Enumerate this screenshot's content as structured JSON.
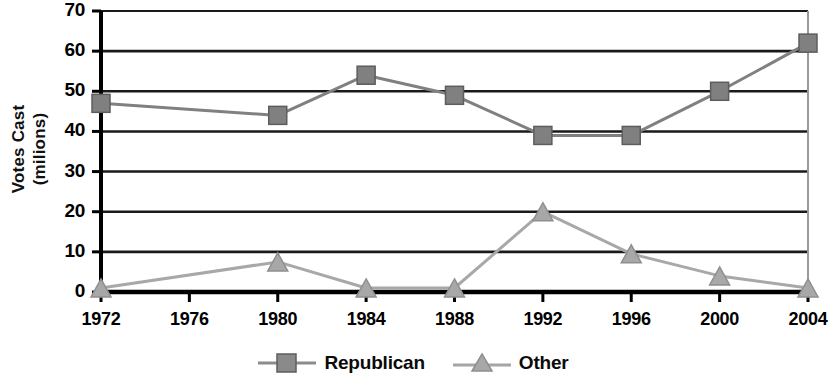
{
  "chart_data": {
    "type": "line",
    "title": "",
    "xlabel": "",
    "ylabel": "Votes Cast (milions)",
    "ylabel_lines": [
      "Votes Cast",
      "(milions)"
    ],
    "categories": [
      "1972",
      "1976",
      "1980",
      "1984",
      "1988",
      "1992",
      "1996",
      "2000",
      "2004"
    ],
    "xtick_labels": [
      "1972",
      "1976",
      "1980",
      "1984",
      "1988",
      "1992",
      "1996",
      "2000",
      "2004"
    ],
    "ytick_labels": [
      "0",
      "10",
      "20",
      "30",
      "40",
      "50",
      "60",
      "70"
    ],
    "ytick_values": [
      0,
      10,
      20,
      30,
      40,
      50,
      60,
      70
    ],
    "ylim": [
      0,
      70
    ],
    "grid": "horizontal",
    "legend_position": "bottom-center",
    "series": [
      {
        "name": "Republican",
        "marker": "square",
        "color": "#808080",
        "values": [
          47,
          null,
          44,
          54,
          49,
          39,
          39,
          50,
          62
        ],
        "marker_years": [
          "1972",
          "1980",
          "1984",
          "1988",
          "1992",
          "1996",
          "2000",
          "2004"
        ]
      },
      {
        "name": "Other",
        "marker": "triangle",
        "color": "#a8a8a8",
        "values": [
          1,
          null,
          7.5,
          1,
          1,
          20,
          9.5,
          4,
          1
        ],
        "marker_years": [
          "1972",
          "1980",
          "1984",
          "1988",
          "1992",
          "1996",
          "2000",
          "2004"
        ]
      }
    ]
  },
  "legend": {
    "items": [
      {
        "label": "Republican",
        "marker": "square-marker",
        "color": "#808080"
      },
      {
        "label": "Other",
        "marker": "triangle-marker",
        "color": "#a8a8a8"
      }
    ]
  },
  "colors": {
    "republican": "#808080",
    "other": "#a8a8a8",
    "axis": "#000000",
    "gridline": "#1a1a1a",
    "background": "#ffffff"
  }
}
